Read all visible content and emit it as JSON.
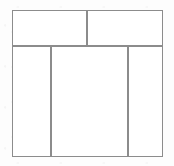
{
  "diagram": {
    "style": {
      "line_color": "#8c8c8c",
      "fill_color": "#ffffff",
      "page_color": "#fdfdfd",
      "line_width_px": 1
    },
    "frame": {
      "x": 12,
      "y": 10,
      "width": 151,
      "height": 147
    },
    "rows": [
      {
        "name": "header-row",
        "y": 10,
        "height": 36,
        "cells": [
          {
            "name": "header-left-cell",
            "label": "",
            "x": 12,
            "y": 10,
            "width": 75,
            "height": 36
          },
          {
            "name": "header-right-cell",
            "label": "",
            "x": 87,
            "y": 10,
            "width": 76,
            "height": 36
          }
        ]
      },
      {
        "name": "body-row",
        "y": 46,
        "height": 111,
        "cells": [
          {
            "name": "body-left-column",
            "label": "",
            "x": 12,
            "y": 46,
            "width": 39,
            "height": 111
          },
          {
            "name": "body-center-column",
            "label": "",
            "x": 51,
            "y": 46,
            "width": 77,
            "height": 111
          },
          {
            "name": "body-right-column",
            "label": "",
            "x": 128,
            "y": 46,
            "width": 35,
            "height": 111
          }
        ]
      }
    ],
    "dividers": [
      {
        "name": "header-body-divider",
        "orientation": "horizontal",
        "x": 12,
        "y": 46,
        "length": 151
      },
      {
        "name": "header-column-divider",
        "orientation": "vertical",
        "x": 87,
        "y": 10,
        "length": 36
      },
      {
        "name": "body-divider-left",
        "orientation": "vertical",
        "x": 51,
        "y": 46,
        "length": 111
      },
      {
        "name": "body-divider-right",
        "orientation": "vertical",
        "x": 128,
        "y": 46,
        "length": 111
      }
    ]
  }
}
